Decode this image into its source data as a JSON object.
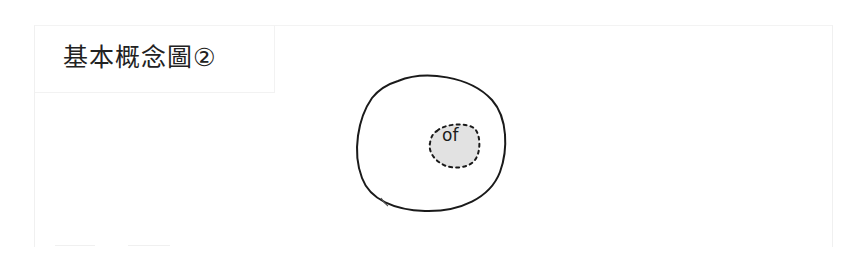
{
  "title": "基本概念圖②",
  "diagram": {
    "outer_shape": {
      "type": "hand-drawn-circle",
      "stroke": "#1a1a1a",
      "fill": "#ffffff"
    },
    "inner_shape": {
      "type": "dashed-blob",
      "stroke": "#1a1a1a",
      "fill": "#e2e2e2",
      "label": "of"
    }
  },
  "colors": {
    "background": "#ffffff",
    "frame": "#f0f0f0",
    "text": "#222222"
  }
}
